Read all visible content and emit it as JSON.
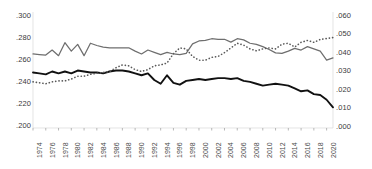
{
  "chart_data": {
    "type": "line",
    "title": "",
    "subtitle": "",
    "xlabel": "",
    "ylabel": "",
    "grid": false,
    "legend_position": "none",
    "x": [
      1974,
      1975,
      1976,
      1977,
      1978,
      1979,
      1980,
      1981,
      1982,
      1983,
      1984,
      1985,
      1986,
      1987,
      1988,
      1989,
      1990,
      1991,
      1992,
      1993,
      1994,
      1995,
      1996,
      1997,
      1998,
      1999,
      2000,
      2001,
      2002,
      2003,
      2004,
      2005,
      2006,
      2007,
      2008,
      2009,
      2010,
      2011,
      2012,
      2013,
      2014,
      2015,
      2016,
      2017,
      2018,
      2019,
      2020,
      2021
    ],
    "xtick_labels": [
      "1974",
      "1976",
      "1978",
      "1980",
      "1982",
      "1984",
      "1986",
      "1988",
      "1990",
      "1992",
      "1994",
      "1996",
      "1998",
      "2000",
      "2002",
      "2004",
      "2006",
      "2008",
      "2010",
      "2012",
      "2014",
      "2016",
      "2018",
      "2020"
    ],
    "xtick_step": 2,
    "xlim": [
      1974,
      2021
    ],
    "axes": [
      {
        "id": "left",
        "position": "left",
        "ylim": [
          0.2,
          0.3
        ],
        "ytick_labels": [
          ".300",
          ".280",
          ".260",
          ".240",
          ".220",
          ".200"
        ],
        "ytick_values": [
          0.3,
          0.28,
          0.26,
          0.24,
          0.22,
          0.2
        ]
      },
      {
        "id": "right",
        "position": "right",
        "ylim": [
          0.0,
          0.06
        ],
        "ytick_labels": [
          ".060",
          ".050",
          ".040",
          ".030",
          ".020",
          ".010",
          ".000"
        ],
        "ytick_values": [
          0.06,
          0.05,
          0.04,
          0.03,
          0.02,
          0.01,
          0.0
        ]
      }
    ],
    "series": [
      {
        "name": "series-gray-solid",
        "style": "solid",
        "color": "#6e6e6e",
        "axis": "left",
        "values": [
          0.2655,
          0.265,
          0.2645,
          0.269,
          0.264,
          0.2755,
          0.268,
          0.274,
          0.264,
          0.275,
          0.273,
          0.2715,
          0.271,
          0.271,
          0.271,
          0.271,
          0.268,
          0.2655,
          0.269,
          0.267,
          0.265,
          0.267,
          0.2655,
          0.265,
          0.266,
          0.2745,
          0.277,
          0.2775,
          0.279,
          0.2785,
          0.2785,
          0.276,
          0.279,
          0.278,
          0.275,
          0.274,
          0.272,
          0.2695,
          0.2665,
          0.266,
          0.268,
          0.2705,
          0.269,
          0.272,
          0.27,
          0.268,
          0.26,
          0.262
        ]
      },
      {
        "name": "series-black-solid",
        "style": "solid",
        "color": "#111111",
        "axis": "right",
        "values": [
          0.0295,
          0.029,
          0.0285,
          0.03,
          0.029,
          0.03,
          0.029,
          0.0305,
          0.03,
          0.0295,
          0.0295,
          0.029,
          0.03,
          0.0305,
          0.0305,
          0.03,
          0.029,
          0.028,
          0.029,
          0.0255,
          0.0235,
          0.028,
          0.024,
          0.023,
          0.025,
          0.0255,
          0.026,
          0.0255,
          0.026,
          0.0265,
          0.0265,
          0.026,
          0.0265,
          0.025,
          0.0245,
          0.0235,
          0.0225,
          0.023,
          0.0235,
          0.023,
          0.0225,
          0.021,
          0.0195,
          0.02,
          0.018,
          0.0175,
          0.015,
          0.011
        ]
      },
      {
        "name": "series-gray-dotted",
        "style": "dotted",
        "color": "#5a5a5a",
        "axis": "right",
        "values": [
          0.0245,
          0.024,
          0.0235,
          0.0245,
          0.025,
          0.025,
          0.026,
          0.0275,
          0.0275,
          0.0285,
          0.029,
          0.0295,
          0.03,
          0.032,
          0.0335,
          0.033,
          0.031,
          0.03,
          0.031,
          0.033,
          0.0335,
          0.0345,
          0.0395,
          0.0425,
          0.042,
          0.038,
          0.036,
          0.036,
          0.0375,
          0.038,
          0.04,
          0.0425,
          0.045,
          0.044,
          0.042,
          0.041,
          0.042,
          0.0425,
          0.042,
          0.0445,
          0.045,
          0.043,
          0.0455,
          0.0465,
          0.0455,
          0.047,
          0.0475,
          0.048
        ]
      }
    ]
  }
}
